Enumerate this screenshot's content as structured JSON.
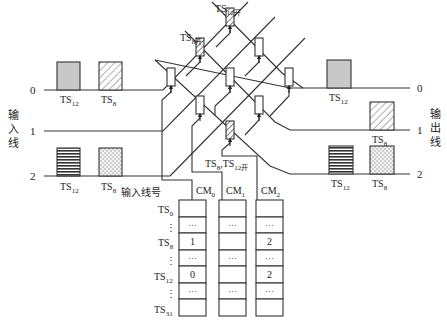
{
  "diagram": {
    "title": "",
    "input_side": {
      "label": "输入线",
      "lines": [
        {
          "id": "0",
          "label": "0",
          "slots": [
            {
              "name": "TS12",
              "sub": "12",
              "pattern": "gray"
            },
            {
              "name": "TS8",
              "sub": "8",
              "pattern": "diagonal"
            }
          ]
        },
        {
          "id": "1",
          "label": "1",
          "slots": []
        },
        {
          "id": "2",
          "label": "2",
          "slots": [
            {
              "name": "TS12",
              "sub": "12",
              "pattern": "horizontal"
            },
            {
              "name": "TS8",
              "sub": "8",
              "pattern": "checker"
            }
          ]
        }
      ]
    },
    "output_side": {
      "label": "输出线",
      "lines": [
        {
          "id": "0",
          "label": "0",
          "slots": [
            {
              "name": "TS12",
              "sub": "12",
              "pattern": "gray"
            }
          ]
        },
        {
          "id": "1",
          "label": "1",
          "slots": [
            {
              "name": "TS8",
              "sub": "8",
              "pattern": "diagonal"
            }
          ]
        },
        {
          "id": "2",
          "label": "2",
          "slots": [
            {
              "name": "TS12",
              "sub": "12",
              "pattern": "horizontal"
            },
            {
              "name": "TS8",
              "sub": "8",
              "pattern": "checker"
            }
          ]
        }
      ]
    },
    "crosspoint_labels": {
      "ts12_open": {
        "base": "TS",
        "sub": "12开"
      },
      "ts8_open": {
        "base": "TS",
        "sub": "8开"
      },
      "ts8_ts12_open": {
        "part1": "TS",
        "sub1": "8",
        "sep": ",",
        "part2": "TS",
        "sub2": "12开"
      }
    },
    "control_memory": {
      "row_header_label": "输入线号",
      "row_labels": [
        {
          "base": "TS",
          "sub": "0"
        },
        {
          "base": "⋮",
          "sub": ""
        },
        {
          "base": "TS",
          "sub": "8"
        },
        {
          "base": "⋮",
          "sub": ""
        },
        {
          "base": "TS",
          "sub": "12"
        },
        {
          "base": "⋮",
          "sub": ""
        },
        {
          "base": "TS",
          "sub": "31"
        }
      ],
      "columns": [
        {
          "name": "CM",
          "sub": "0",
          "cells": [
            "",
            "···",
            "1",
            "···",
            "0",
            "···",
            ""
          ]
        },
        {
          "name": "CM",
          "sub": "1",
          "cells": [
            "",
            "···",
            "",
            "···",
            "",
            "···",
            ""
          ]
        },
        {
          "name": "CM",
          "sub": "2",
          "cells": [
            "",
            "···",
            "2",
            "···",
            "2",
            "···",
            ""
          ]
        }
      ]
    },
    "colors": {
      "line": "#333333",
      "gray_fill": "#c8c8c8",
      "background": "#ffffff"
    }
  }
}
